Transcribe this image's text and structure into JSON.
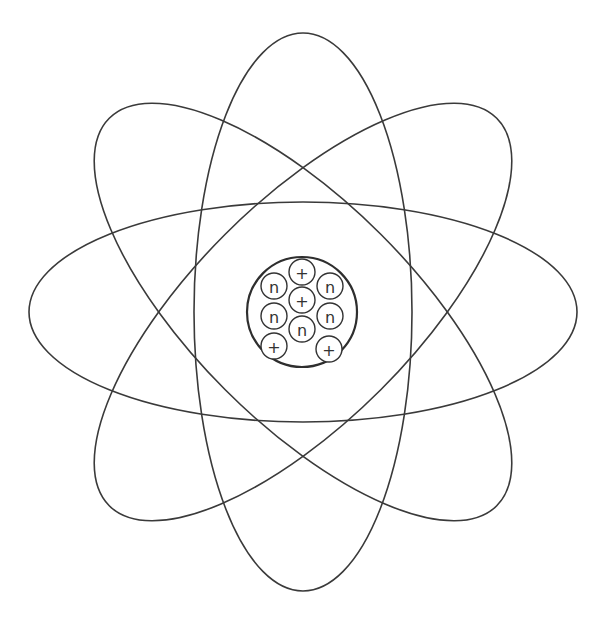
{
  "diagram": {
    "title": "",
    "orbit_count": 4,
    "orbit_rotations_deg": [
      0,
      45,
      90,
      -45
    ],
    "nucleus": {
      "particles": [
        {
          "type": "proton",
          "symbol": "+"
        },
        {
          "type": "neutron",
          "symbol": "n"
        },
        {
          "type": "proton",
          "symbol": "+"
        },
        {
          "type": "neutron",
          "symbol": "n"
        },
        {
          "type": "neutron",
          "symbol": "n"
        },
        {
          "type": "neutron",
          "symbol": "n"
        },
        {
          "type": "neutron",
          "symbol": "n"
        },
        {
          "type": "proton",
          "symbol": "+"
        },
        {
          "type": "proton",
          "symbol": "+"
        }
      ],
      "proton_count": 4,
      "neutron_count": 5
    },
    "colors": {
      "line": "#333333",
      "background": "#ffffff"
    }
  }
}
